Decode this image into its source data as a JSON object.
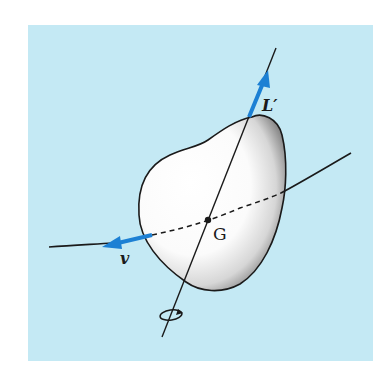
{
  "figure": {
    "background_color": "#c4e9f4",
    "body_fill_highlight": "#ffffff",
    "body_fill_shadow": "#6f6f6f",
    "vector_color": "#1c80d4",
    "line_color": "#1a1a1a",
    "labels": {
      "angular_momentum": "L′",
      "velocity": "v",
      "center_of_mass": "G"
    },
    "elements": {
      "rigid_body": "irregular rigid body (kidney-shaped)",
      "rotation_axis": "axis through G",
      "trajectory": "path of G (dashed where behind body)",
      "rotation_indicator": "circular arrow around axis"
    }
  }
}
